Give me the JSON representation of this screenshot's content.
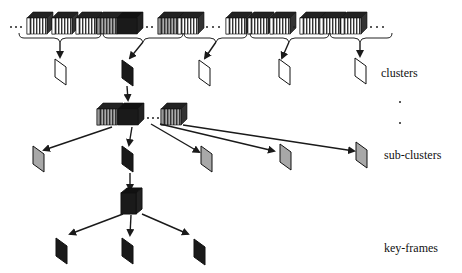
{
  "labels": {
    "clusters": "clusters",
    "sub_clusters": "sub-clusters",
    "key_frames": "key-frames"
  },
  "colors": {
    "white_shot": "#ffffff",
    "gray_shot": "#9a9a9a",
    "black_shot": "#1a1a1a",
    "stroke": "#1a1a1a"
  },
  "levels": [
    {
      "name": "shots",
      "groups": 5
    },
    {
      "name": "clusters",
      "frames": 5,
      "selected_index": 1
    },
    {
      "name": "sub-clusters",
      "frames": 5,
      "selected_index": 1
    },
    {
      "name": "key-frames",
      "frames": 3
    }
  ]
}
